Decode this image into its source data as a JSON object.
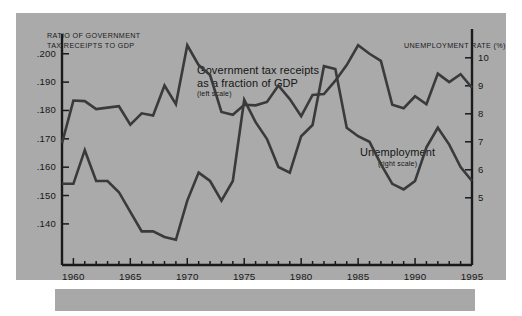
{
  "figure": {
    "background": "#ffffff",
    "panel_color": "#aaaaaa",
    "line_color": "#3a3a3a",
    "axis_color": "#1a1a1a"
  },
  "chart_data": {
    "type": "line",
    "title": "",
    "subtitle": "",
    "xlabel": "",
    "ylabel": "RATIO OF GOVERNMENT TAX RECEIPTS TO GDP",
    "y2label": "UNEMPLOYMENT RATE (%)",
    "grid": false,
    "legend": "inline-annotations",
    "xlim": [
      1959,
      1995
    ],
    "x_ticks_major": [
      1960,
      1965,
      1970,
      1975,
      1980,
      1985,
      1990,
      1995
    ],
    "x_tick_labels": [
      "1960",
      "1965",
      "1970",
      "1975",
      "1980",
      "1985",
      "1990",
      "1995"
    ],
    "x_minor_tick_interval": 1,
    "ylim_left": [
      0.1255,
      0.2045
    ],
    "y_ticks_left": [
      0.2,
      0.19,
      0.18,
      0.17,
      0.16,
      0.15,
      0.14
    ],
    "y_tick_labels_left": [
      ".200",
      ".190",
      ".180",
      ".170",
      ".160",
      ".150",
      ".140"
    ],
    "ylim_right": [
      2.6,
      10.6
    ],
    "y_ticks_right": [
      10,
      9,
      8,
      7,
      6,
      5
    ],
    "y_tick_labels_right": [
      "10",
      "9",
      "8",
      "7",
      "6",
      "5"
    ],
    "x": [
      1959,
      1960,
      1961,
      1962,
      1963,
      1964,
      1965,
      1966,
      1967,
      1968,
      1969,
      1970,
      1971,
      1972,
      1973,
      1974,
      1975,
      1976,
      1977,
      1978,
      1979,
      1980,
      1981,
      1982,
      1983,
      1984,
      1985,
      1986,
      1987,
      1988,
      1989,
      1990,
      1991,
      1992,
      1993,
      1994,
      1995
    ],
    "series": [
      {
        "name": "Government tax receipts as a fraction of GDP",
        "axis": "left",
        "label_line1": "Government tax receipts",
        "label_line2": "as a fraction of GDP",
        "label_scale": "(left scale)",
        "values": [
          0.1685,
          0.1835,
          0.1833,
          0.1805,
          0.181,
          0.1815,
          0.175,
          0.179,
          0.1782,
          0.1888,
          0.1822,
          0.203,
          0.196,
          0.1925,
          0.1795,
          0.1785,
          0.182,
          0.1818,
          0.183,
          0.1888,
          0.184,
          0.178,
          0.1855,
          0.1858,
          0.1905,
          0.196,
          0.203,
          0.2,
          0.1975,
          0.182,
          0.1808,
          0.185,
          0.1822,
          0.193,
          0.19,
          0.1928,
          0.188
        ],
        "values_tail": [
          0.1855,
          0.185,
          0.1848,
          0.188,
          0.192
        ]
      },
      {
        "name": "Unemployment",
        "axis": "right",
        "label_line1": "Unemployment",
        "label_scale": "(right scale)",
        "values": [
          5.5,
          5.5,
          6.7,
          5.6,
          5.6,
          5.2,
          4.5,
          3.8,
          3.8,
          3.6,
          3.5,
          4.9,
          5.9,
          5.6,
          4.9,
          5.6,
          8.5,
          7.7,
          7.1,
          6.1,
          5.9,
          7.2,
          7.6,
          9.7,
          9.6,
          7.5,
          7.2,
          7.0,
          6.2,
          5.5,
          5.3,
          5.6,
          6.8,
          7.5,
          6.9,
          6.1,
          5.6
        ]
      }
    ],
    "annotations": [
      {
        "text": "Government tax receipts as a fraction of GDP (left scale)",
        "x": 1969.5,
        "y_left": 0.2005
      },
      {
        "text": "Unemployment (right scale)",
        "x": 1984.5,
        "y_right": 9.3
      }
    ]
  },
  "axes": {
    "left_title_line1": "RATIO OF GOVERNMENT",
    "left_title_line2": "TAX RECEIPTS TO GDP",
    "right_title": "UNEMPLOYMENT RATE (%)"
  }
}
